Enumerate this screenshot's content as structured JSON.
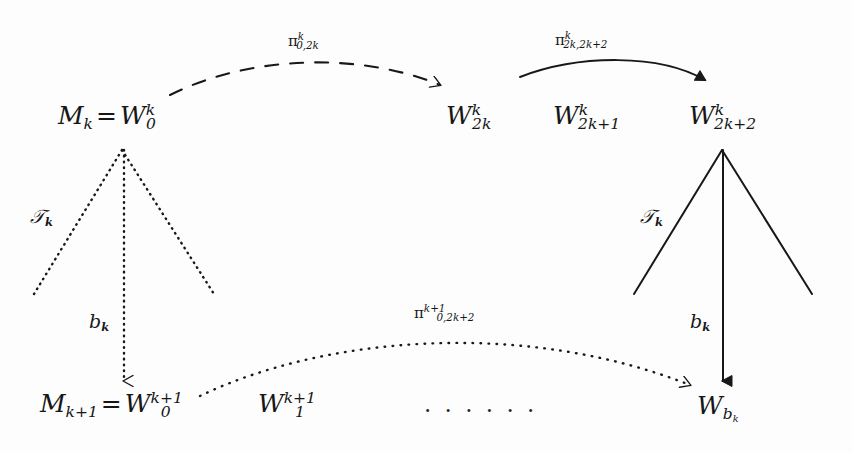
{
  "figure": {
    "kind": "commutative-diagram",
    "background_color": "#fdfdfd",
    "ink_color": "#181818"
  },
  "nodes": {
    "top_left": {
      "lhs": "M",
      "lhs_sub": "k",
      "equals": "=",
      "rhs": "W",
      "rhs_sub": "0",
      "rhs_sup": "k"
    },
    "top_2k": {
      "base": "W",
      "sub": "2k",
      "sup": "k"
    },
    "top_2k1": {
      "base": "W",
      "sub": "2k+1",
      "sup": "k"
    },
    "top_2k2": {
      "base": "W",
      "sub": "2k+2",
      "sup": "k"
    },
    "bottom_left": {
      "lhs": "M",
      "lhs_sub": "k+1",
      "equals": "=",
      "rhs": "W",
      "rhs_sub": "0",
      "rhs_sup": "k+1"
    },
    "bottom_1": {
      "base": "W",
      "sub": "1",
      "sup": "k+1"
    },
    "bottom_ellipsis": "· · · · · ·",
    "bottom_right": {
      "base": "W",
      "sub": "b",
      "sub2": "k"
    }
  },
  "arrows": {
    "dashed_top": {
      "pi": "π",
      "sub": "0,2k",
      "sup": "k",
      "style": "dashed",
      "from": "M_k = W^k_0",
      "to": "W^k_2k"
    },
    "solid_top": {
      "pi": "π",
      "sub": "2k,2k+2",
      "sup": "k",
      "style": "solid",
      "from": "W^k_2k",
      "to": "W^k_2k+2"
    },
    "dotted_bottom": {
      "pi": "π",
      "sub": "0,2k+2",
      "sup": "k+1",
      "style": "dotted",
      "from": "M_k+1 = W^k+1_0",
      "to": "W_b_k"
    },
    "left_vertical": {
      "label": "b",
      "label_sub": "k",
      "style": "dotted"
    },
    "right_vertical": {
      "label": "b",
      "label_sub": "k",
      "style": "solid"
    }
  },
  "cones": {
    "left": {
      "label": "𝒯",
      "label_plain": "T",
      "label_sub": "k",
      "style": "dotted"
    },
    "right": {
      "label": "𝒯",
      "label_plain": "T",
      "label_sub": "k",
      "style": "solid"
    }
  }
}
